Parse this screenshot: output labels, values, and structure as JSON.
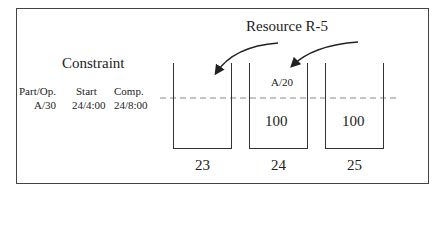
{
  "diagram": {
    "constraint": {
      "title": "Constraint",
      "headers": [
        "Part/Op.",
        "Start",
        "Comp."
      ],
      "values": [
        "A/30",
        "24/4:00",
        "24/8:00"
      ]
    },
    "resource": {
      "label": "Resource R-5",
      "buckets": [
        {
          "day": "23",
          "op_label": "",
          "capacity": ""
        },
        {
          "day": "24",
          "op_label": "A/20",
          "capacity": "100"
        },
        {
          "day": "25",
          "op_label": "",
          "capacity": "100"
        }
      ]
    },
    "colors": {
      "line": "#333333",
      "dashed": "#888888"
    }
  }
}
